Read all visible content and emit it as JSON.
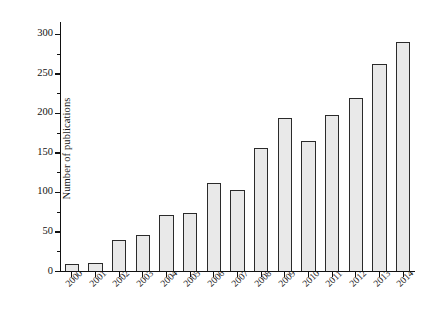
{
  "chart_data": {
    "type": "bar",
    "title": "",
    "subtitle": "",
    "xlabel": "",
    "ylabel": "Number of publications",
    "categories": [
      "2000",
      "2001",
      "2002",
      "2003",
      "2004",
      "2005",
      "2006",
      "2007",
      "2008",
      "2009",
      "2010",
      "2011",
      "2012",
      "2013",
      "2014"
    ],
    "values": [
      9,
      10,
      39,
      46,
      71,
      73,
      111,
      103,
      156,
      193,
      164,
      197,
      219,
      262,
      290
    ],
    "series": [
      {
        "name": "Number of publications",
        "values": [
          9,
          10,
          39,
          46,
          71,
          73,
          111,
          103,
          156,
          193,
          164,
          197,
          219,
          262,
          290
        ]
      }
    ],
    "ylim": [
      0,
      315
    ],
    "xlim": [
      0,
      15
    ],
    "ytick_labels": [
      "0",
      "50",
      "100",
      "150",
      "200",
      "250",
      "300"
    ],
    "ytick_values": [
      0,
      50,
      100,
      150,
      200,
      250,
      300
    ],
    "ytick_minor_values": [
      25,
      75,
      125,
      175,
      225,
      275
    ],
    "grid": false,
    "legend": false,
    "legend_position": "none",
    "bar_fill_color": "#e9e9e9",
    "bar_edge_color": "#2b2b2b",
    "axis_color": "#111111",
    "background_color": "#ffffff",
    "xtick_label_rotation": -45
  },
  "axes": {
    "y_title": "Number of publications"
  }
}
